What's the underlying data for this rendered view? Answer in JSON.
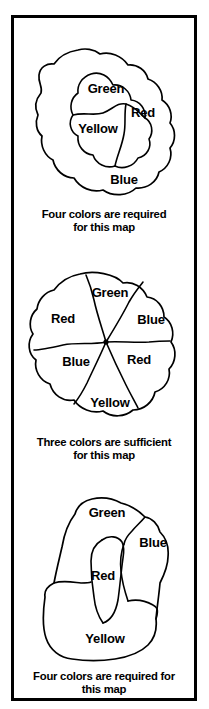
{
  "figure": {
    "ink_color": "#000000",
    "background_color": "#ffffff",
    "border_color": "#000000"
  },
  "panels": [
    {
      "id": "map-1",
      "caption": "Four colors are required\nfor this map",
      "regions": [
        {
          "label": "Green",
          "x": 92,
          "y": 57
        },
        {
          "label": "Red",
          "x": 129,
          "y": 81
        },
        {
          "label": "Yellow",
          "x": 84,
          "y": 97
        },
        {
          "label": "Blue",
          "x": 110,
          "y": 148
        }
      ]
    },
    {
      "id": "map-2",
      "caption": "Three colors are sufficient\nfor this map",
      "regions": [
        {
          "label": "Green",
          "x": 96,
          "y": 33
        },
        {
          "label": "Red",
          "x": 49,
          "y": 59
        },
        {
          "label": "Blue",
          "x": 137,
          "y": 60
        },
        {
          "label": "Blue",
          "x": 62,
          "y": 102
        },
        {
          "label": "Red",
          "x": 125,
          "y": 100
        },
        {
          "label": "Yellow",
          "x": 96,
          "y": 143
        }
      ]
    },
    {
      "id": "map-3",
      "caption": "Four colors are required for\nthis map",
      "regions": [
        {
          "label": "Green",
          "x": 93,
          "y": 27
        },
        {
          "label": "Blue",
          "x": 139,
          "y": 57
        },
        {
          "label": "Red",
          "x": 89,
          "y": 90
        },
        {
          "label": "Yellow",
          "x": 91,
          "y": 153
        }
      ]
    }
  ]
}
